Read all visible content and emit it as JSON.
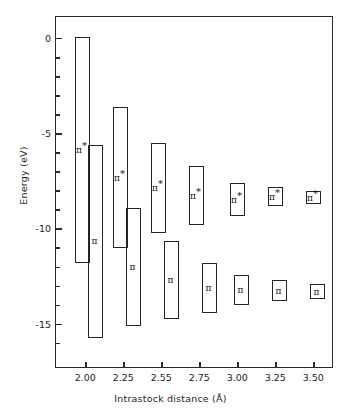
{
  "chart_data": {
    "type": "bar",
    "title": "",
    "xlabel": "Intrastock distance (Å)",
    "ylabel": "Energy (eV)",
    "xtick_labels": [
      "2.00",
      "2.25",
      "2.55",
      "2.75",
      "3.00",
      "3.25",
      "3.50"
    ],
    "ytick_labels": [
      "0",
      "-5",
      "-10",
      "-15"
    ],
    "ytick_values": [
      0,
      -5,
      -10,
      -15
    ],
    "yminor_values": [
      -1,
      -2,
      -3,
      -4,
      -6,
      -7,
      -8,
      -9,
      -11,
      -12,
      -13,
      -14,
      -16
    ],
    "ylim": [
      -17.3,
      1.2
    ],
    "grid": false,
    "legend": null,
    "note": "Band (energy-range) diagram: each category shows a pi* band and a pi band drawn as open rectangles spanning their energy width.",
    "series": [
      {
        "name": "π*",
        "label": "π*",
        "bands": [
          {
            "x": "2.00",
            "top": 0.1,
            "bottom": -11.8
          },
          {
            "x": "2.25",
            "top": -3.6,
            "bottom": -11.0
          },
          {
            "x": "2.55",
            "top": -5.5,
            "bottom": -10.2
          },
          {
            "x": "2.75",
            "top": -6.7,
            "bottom": -9.8
          },
          {
            "x": "3.00",
            "top": -7.6,
            "bottom": -9.3
          },
          {
            "x": "3.25",
            "top": -7.8,
            "bottom": -8.8
          },
          {
            "x": "3.50",
            "top": -8.0,
            "bottom": -8.7
          }
        ]
      },
      {
        "name": "π",
        "label": "π",
        "bands": [
          {
            "x": "2.00",
            "top": -5.6,
            "bottom": -15.7
          },
          {
            "x": "2.25",
            "top": -8.9,
            "bottom": -15.1
          },
          {
            "x": "2.55",
            "top": -10.6,
            "bottom": -14.7
          },
          {
            "x": "2.75",
            "top": -11.8,
            "bottom": -14.4
          },
          {
            "x": "3.00",
            "top": -12.4,
            "bottom": -14.0
          },
          {
            "x": "3.25",
            "top": -12.7,
            "bottom": -13.8
          },
          {
            "x": "3.50",
            "top": -12.9,
            "bottom": -13.7
          }
        ]
      }
    ],
    "colors": {
      "line": "#242424",
      "text": "#1d1d1d",
      "background": "#ffffff"
    }
  },
  "axes": {
    "y_title": "Energy (eV)",
    "x_title": "Intrastock distance (Å)"
  }
}
